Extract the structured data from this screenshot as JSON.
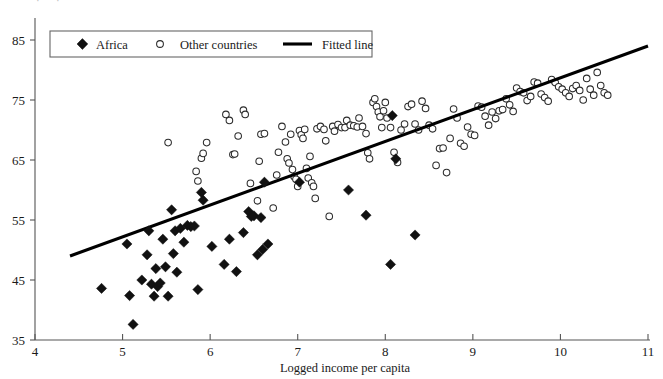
{
  "chart_data": {
    "type": "scatter",
    "title": "",
    "xlabel": "Logged income per capita",
    "ylabel": "",
    "xlim": [
      4,
      11
    ],
    "ylim": [
      35,
      87
    ],
    "xticks": [
      4,
      5,
      6,
      7,
      8,
      9,
      10,
      11
    ],
    "yticks": [
      35,
      45,
      55,
      65,
      75,
      85
    ],
    "xtick_labels": [
      "4",
      "5",
      "6",
      "7",
      "8",
      "9",
      "10",
      "11"
    ],
    "ytick_labels": [
      "35",
      "45",
      "55",
      "65",
      "75",
      "85"
    ],
    "grid": false,
    "legend_position": "top-left",
    "legend": [
      {
        "label": "Africa",
        "marker": "filled-diamond",
        "color": "#111111"
      },
      {
        "label": "Other countries",
        "marker": "open-circle",
        "color": "#2b2b2b"
      },
      {
        "label": "Fitted line",
        "marker": "line",
        "color": "#000000"
      }
    ],
    "series": [
      {
        "name": "Africa",
        "marker": "filled-diamond",
        "color": "#111111",
        "points": [
          [
            4.76,
            43.6
          ],
          [
            5.05,
            51.0
          ],
          [
            5.08,
            42.4
          ],
          [
            5.12,
            37.6
          ],
          [
            5.22,
            45.0
          ],
          [
            5.28,
            49.2
          ],
          [
            5.3,
            53.2
          ],
          [
            5.33,
            44.3
          ],
          [
            5.36,
            42.3
          ],
          [
            5.38,
            46.9
          ],
          [
            5.4,
            43.9
          ],
          [
            5.43,
            44.5
          ],
          [
            5.46,
            51.8
          ],
          [
            5.49,
            47.2
          ],
          [
            5.52,
            42.3
          ],
          [
            5.56,
            56.7
          ],
          [
            5.58,
            49.4
          ],
          [
            5.6,
            53.2
          ],
          [
            5.62,
            46.3
          ],
          [
            5.66,
            53.6
          ],
          [
            5.7,
            51.3
          ],
          [
            5.74,
            54.1
          ],
          [
            5.78,
            53.9
          ],
          [
            5.82,
            54.0
          ],
          [
            5.86,
            43.4
          ],
          [
            5.9,
            59.6
          ],
          [
            5.92,
            58.3
          ],
          [
            6.02,
            50.6
          ],
          [
            6.16,
            47.6
          ],
          [
            6.22,
            51.8
          ],
          [
            6.3,
            46.4
          ],
          [
            6.38,
            52.9
          ],
          [
            6.44,
            56.4
          ],
          [
            6.47,
            55.6
          ],
          [
            6.5,
            55.7
          ],
          [
            6.54,
            49.2
          ],
          [
            6.58,
            55.4
          ],
          [
            6.6,
            50.1
          ],
          [
            6.62,
            61.3
          ],
          [
            6.66,
            51.0
          ],
          [
            7.02,
            61.3
          ],
          [
            7.58,
            60.0
          ],
          [
            7.78,
            55.8
          ],
          [
            8.06,
            47.6
          ],
          [
            8.12,
            65.2
          ],
          [
            8.34,
            52.5
          ],
          [
            8.08,
            72.4
          ]
        ]
      },
      {
        "name": "Other countries",
        "marker": "open-circle",
        "color": "#2b2b2b",
        "points": [
          [
            5.52,
            67.9
          ],
          [
            5.84,
            63.1
          ],
          [
            5.86,
            61.5
          ],
          [
            5.9,
            65.3
          ],
          [
            5.92,
            66.1
          ],
          [
            5.96,
            67.9
          ],
          [
            6.18,
            72.6
          ],
          [
            6.22,
            71.6
          ],
          [
            6.26,
            65.9
          ],
          [
            6.28,
            66.0
          ],
          [
            6.32,
            69.0
          ],
          [
            6.38,
            73.3
          ],
          [
            6.4,
            72.6
          ],
          [
            6.46,
            61.1
          ],
          [
            6.54,
            58.2
          ],
          [
            6.56,
            64.8
          ],
          [
            6.58,
            69.3
          ],
          [
            6.62,
            69.4
          ],
          [
            6.72,
            57.0
          ],
          [
            6.76,
            62.5
          ],
          [
            6.78,
            66.3
          ],
          [
            6.82,
            70.6
          ],
          [
            6.86,
            68.0
          ],
          [
            6.88,
            65.2
          ],
          [
            6.9,
            64.5
          ],
          [
            6.92,
            69.3
          ],
          [
            6.94,
            63.4
          ],
          [
            6.96,
            62.2
          ],
          [
            6.98,
            61.8
          ],
          [
            7.0,
            60.6
          ],
          [
            7.02,
            69.9
          ],
          [
            7.04,
            69.2
          ],
          [
            7.06,
            68.6
          ],
          [
            7.08,
            70.1
          ],
          [
            7.1,
            63.6
          ],
          [
            7.12,
            62.0
          ],
          [
            7.14,
            65.6
          ],
          [
            7.16,
            61.2
          ],
          [
            7.18,
            60.6
          ],
          [
            7.2,
            58.6
          ],
          [
            7.22,
            70.2
          ],
          [
            7.26,
            70.6
          ],
          [
            7.3,
            70.1
          ],
          [
            7.32,
            68.2
          ],
          [
            7.36,
            55.6
          ],
          [
            7.4,
            70.6
          ],
          [
            7.42,
            69.8
          ],
          [
            7.46,
            70.9
          ],
          [
            7.5,
            70.4
          ],
          [
            7.54,
            70.4
          ],
          [
            7.56,
            71.6
          ],
          [
            7.6,
            70.8
          ],
          [
            7.64,
            70.7
          ],
          [
            7.68,
            70.5
          ],
          [
            7.7,
            72.0
          ],
          [
            7.74,
            70.6
          ],
          [
            7.78,
            69.4
          ],
          [
            7.8,
            66.2
          ],
          [
            7.82,
            65.2
          ],
          [
            7.86,
            74.6
          ],
          [
            7.88,
            75.2
          ],
          [
            7.9,
            73.9
          ],
          [
            7.92,
            73.0
          ],
          [
            7.94,
            72.2
          ],
          [
            7.96,
            70.4
          ],
          [
            7.98,
            73.2
          ],
          [
            8.0,
            74.6
          ],
          [
            8.02,
            72.0
          ],
          [
            8.06,
            70.4
          ],
          [
            8.1,
            66.3
          ],
          [
            8.14,
            64.6
          ],
          [
            8.18,
            70.0
          ],
          [
            8.22,
            71.0
          ],
          [
            8.26,
            73.9
          ],
          [
            8.3,
            74.3
          ],
          [
            8.34,
            71.0
          ],
          [
            8.38,
            70.0
          ],
          [
            8.42,
            74.8
          ],
          [
            8.46,
            73.6
          ],
          [
            8.5,
            70.8
          ],
          [
            8.54,
            70.2
          ],
          [
            8.58,
            64.1
          ],
          [
            8.62,
            66.9
          ],
          [
            8.66,
            67.0
          ],
          [
            8.7,
            62.9
          ],
          [
            8.74,
            68.6
          ],
          [
            8.78,
            73.5
          ],
          [
            8.82,
            72.0
          ],
          [
            8.86,
            67.8
          ],
          [
            8.9,
            67.3
          ],
          [
            8.94,
            70.5
          ],
          [
            8.98,
            69.3
          ],
          [
            9.02,
            69.1
          ],
          [
            9.06,
            74.0
          ],
          [
            9.1,
            73.8
          ],
          [
            9.14,
            72.3
          ],
          [
            9.18,
            70.8
          ],
          [
            9.22,
            73.0
          ],
          [
            9.26,
            71.9
          ],
          [
            9.3,
            73.2
          ],
          [
            9.34,
            73.4
          ],
          [
            9.38,
            75.2
          ],
          [
            9.42,
            74.2
          ],
          [
            9.46,
            73.1
          ],
          [
            9.5,
            77.0
          ],
          [
            9.54,
            76.4
          ],
          [
            9.58,
            76.2
          ],
          [
            9.62,
            74.9
          ],
          [
            9.66,
            75.6
          ],
          [
            9.7,
            78.0
          ],
          [
            9.74,
            77.8
          ],
          [
            9.78,
            76.0
          ],
          [
            9.82,
            75.4
          ],
          [
            9.86,
            74.8
          ],
          [
            9.9,
            78.4
          ],
          [
            9.94,
            77.9
          ],
          [
            9.98,
            77.2
          ],
          [
            10.02,
            76.8
          ],
          [
            10.06,
            76.2
          ],
          [
            10.1,
            75.6
          ],
          [
            10.14,
            76.9
          ],
          [
            10.18,
            77.4
          ],
          [
            10.22,
            76.6
          ],
          [
            10.26,
            75.0
          ],
          [
            10.3,
            78.6
          ],
          [
            10.34,
            76.8
          ],
          [
            10.38,
            75.8
          ],
          [
            10.42,
            79.6
          ],
          [
            10.46,
            77.4
          ],
          [
            10.5,
            76.2
          ],
          [
            10.54,
            75.8
          ]
        ]
      }
    ],
    "fitted_line": {
      "name": "Fitted line",
      "color": "#000000",
      "x_start": 4.4,
      "y_start": 49.0,
      "x_end": 11.0,
      "y_end": 84.0
    }
  },
  "axes": {
    "x_axis_name": "x-axis",
    "y_axis_name": "y-axis"
  }
}
